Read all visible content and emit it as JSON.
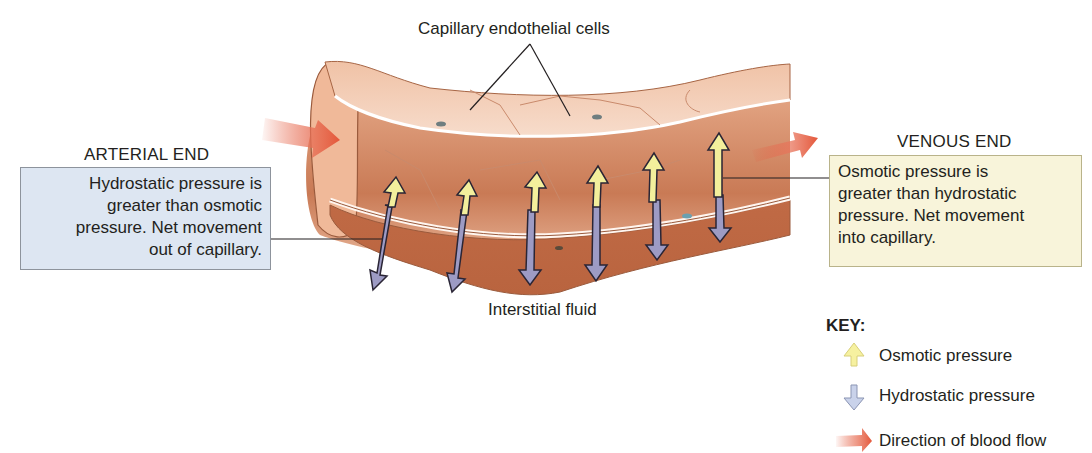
{
  "figure": {
    "labels": {
      "endothelial": "Capillary endothelial cells",
      "interstitial": "Interstitial fluid"
    },
    "arterial_end": {
      "title": "ARTERIAL END",
      "lines": [
        "Hydrostatic pressure is",
        "greater than osmotic",
        "pressure. Net movement",
        "out of capillary."
      ],
      "box_color": "#dde6f2"
    },
    "venous_end": {
      "title": "VENOUS END",
      "lines": [
        "Osmotic pressure is",
        "greater than hydrostatic",
        "pressure. Net movement",
        "into capillary."
      ],
      "box_color": "#f8f4da"
    },
    "key": {
      "title": "KEY:",
      "items": [
        {
          "icon": "up-arrow-yellow-icon",
          "label": "Osmotic pressure",
          "color": "#f6f1a0"
        },
        {
          "icon": "down-arrow-blue-icon",
          "label": "Hydrostatic pressure",
          "color": "#c9d2ea"
        },
        {
          "icon": "right-arrow-red-icon",
          "label": "Direction of blood flow",
          "color": "#e4573a"
        }
      ]
    },
    "colors": {
      "vessel_outer": "#c9764f",
      "vessel_inner": "#eab293",
      "vessel_light": "#f5cfb6",
      "osmotic_arrow": "#f3ef9c",
      "hydrostatic_arrow": "#9d9bc4",
      "flow_arrow": "#e4573a"
    }
  }
}
